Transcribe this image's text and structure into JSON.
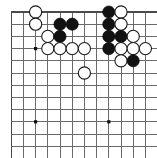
{
  "figure": {
    "kind": "go-board-diagram",
    "caption": "",
    "board": {
      "cols": 12,
      "rows": 12,
      "origin_x": 11.2,
      "origin_y": 12.0,
      "spacing": 12.2,
      "stone_radius": 6.1,
      "line_color": "#6a6a6a",
      "edge_color": "#4a4a4a",
      "background": "#ffffff",
      "black_color": "#121212",
      "white_color": "#ffffff",
      "white_outline": "#1a1a1a",
      "star_color": "#111111",
      "show_left_edge": true,
      "show_top_edge": true,
      "show_right_edge": false,
      "show_bottom_edge": false
    },
    "star_points": [
      {
        "col": 3,
        "row": 4
      },
      {
        "col": 3,
        "row": 10
      },
      {
        "col": 9,
        "row": 10
      }
    ],
    "stones": [
      {
        "col": 3,
        "row": 1,
        "color": "white"
      },
      {
        "col": 9,
        "row": 1,
        "color": "black"
      },
      {
        "col": 10,
        "row": 1,
        "color": "white"
      },
      {
        "col": 3,
        "row": 2,
        "color": "white"
      },
      {
        "col": 5,
        "row": 2,
        "color": "black"
      },
      {
        "col": 6,
        "row": 2,
        "color": "black"
      },
      {
        "col": 9,
        "row": 2,
        "color": "black"
      },
      {
        "col": 10,
        "row": 2,
        "color": "white"
      },
      {
        "col": 4,
        "row": 3,
        "color": "white"
      },
      {
        "col": 5,
        "row": 3,
        "color": "black"
      },
      {
        "col": 9,
        "row": 3,
        "color": "black"
      },
      {
        "col": 10,
        "row": 3,
        "color": "black"
      },
      {
        "col": 11,
        "row": 3,
        "color": "white"
      },
      {
        "col": 4,
        "row": 4,
        "color": "white"
      },
      {
        "col": 5,
        "row": 4,
        "color": "white"
      },
      {
        "col": 6,
        "row": 4,
        "color": "white"
      },
      {
        "col": 7,
        "row": 4,
        "color": "white"
      },
      {
        "col": 9,
        "row": 4,
        "color": "black"
      },
      {
        "col": 10,
        "row": 4,
        "color": "white"
      },
      {
        "col": 11,
        "row": 4,
        "color": "white"
      },
      {
        "col": 12,
        "row": 4,
        "color": "white"
      },
      {
        "col": 10,
        "row": 5,
        "color": "white"
      },
      {
        "col": 11,
        "row": 5,
        "color": "black"
      },
      {
        "col": 7,
        "row": 6,
        "color": "white"
      }
    ],
    "counts": {
      "black_stones": 10,
      "white_stones": 14,
      "total_stones": 24
    }
  }
}
